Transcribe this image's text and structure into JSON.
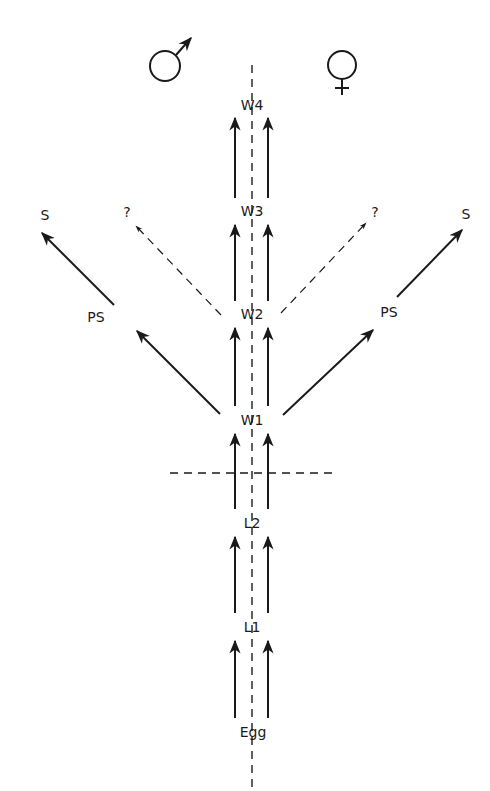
{
  "diagram": {
    "symbols": {
      "male": "male-symbol",
      "female": "female-symbol"
    },
    "stages": {
      "egg": "Egg",
      "l1": "L1",
      "l2": "L2",
      "w1": "W1",
      "w2": "W2",
      "w3": "W3",
      "w4": "W4"
    },
    "branches": {
      "left_ps": "PS",
      "left_s": "S",
      "left_unknown": "?",
      "right_ps": "PS",
      "right_s": "S",
      "right_unknown": "?"
    },
    "stage_order": [
      "Egg",
      "L1",
      "L2",
      "W1",
      "W2",
      "W3",
      "W4"
    ],
    "edges": [
      {
        "from": "Egg",
        "to": "L1",
        "style": "solid",
        "count": 2
      },
      {
        "from": "L1",
        "to": "L2",
        "style": "solid",
        "count": 2
      },
      {
        "from": "L2",
        "to": "W1",
        "style": "solid",
        "count": 2
      },
      {
        "from": "W1",
        "to": "W2",
        "style": "solid",
        "count": 2
      },
      {
        "from": "W2",
        "to": "W3",
        "style": "solid",
        "count": 2
      },
      {
        "from": "W3",
        "to": "W4",
        "style": "solid",
        "count": 2
      },
      {
        "from": "W1",
        "to": "PS (left)",
        "style": "solid"
      },
      {
        "from": "PS (left)",
        "to": "S (left)",
        "style": "solid"
      },
      {
        "from": "W1",
        "to": "PS (right)",
        "style": "solid"
      },
      {
        "from": "PS (right)",
        "to": "S (right)",
        "style": "solid"
      },
      {
        "from": "W2",
        "to": "? (left)",
        "style": "dashed"
      },
      {
        "from": "W2",
        "to": "? (right)",
        "style": "dashed"
      }
    ]
  }
}
